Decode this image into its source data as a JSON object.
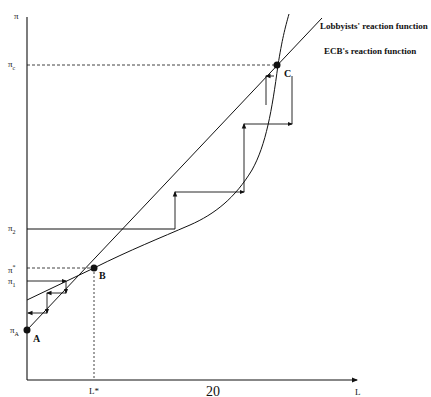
{
  "diagram": {
    "y_axis": {
      "label": "π"
    },
    "x_axis": {
      "label": "L"
    },
    "y_ticks": [
      {
        "id": "pi_c",
        "base": "π",
        "sub": "c",
        "y": 65
      },
      {
        "id": "pi_2",
        "base": "π",
        "sub": "2",
        "y": 229
      },
      {
        "id": "pi_star",
        "base": "π",
        "sub": "*",
        "y": 268
      },
      {
        "id": "pi_1",
        "base": "π",
        "sub": "1",
        "y": 281
      },
      {
        "id": "pi_A",
        "base": "π",
        "sub": "A",
        "y": 330
      }
    ],
    "x_ticks": [
      {
        "id": "L_star",
        "label": "L*",
        "x": 94
      }
    ],
    "points": [
      {
        "label": "A",
        "x": 27,
        "y": 330
      },
      {
        "label": "B",
        "x": 94,
        "y": 268
      },
      {
        "label": "C",
        "x": 277,
        "y": 65
      }
    ],
    "curves": [
      {
        "name": "lobbyists",
        "label": "Lobbyists' reaction function"
      },
      {
        "name": "ecb",
        "label": "ECB's reaction function"
      }
    ],
    "color": "#111111"
  },
  "page": {
    "number": "20"
  }
}
